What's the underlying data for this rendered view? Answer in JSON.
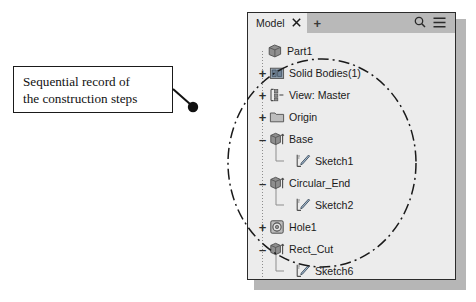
{
  "callout": {
    "line1": "Sequential record of",
    "line2": "the construction steps"
  },
  "panel": {
    "tab": {
      "label": "Model",
      "close_icon": "close-icon",
      "add_icon": "plus-icon"
    },
    "toolbar": {
      "search_icon": "search-icon",
      "menu_icon": "hamburger-menu-icon"
    },
    "tree": [
      {
        "label": "Part1",
        "expander": "",
        "indent": 6,
        "icon": "part-cube-icon",
        "depth": 0
      },
      {
        "label": "Solid Bodies(1)",
        "expander": "+",
        "indent": 8,
        "icon": "solid-bodies-icon",
        "depth": 1
      },
      {
        "label": "View: Master",
        "expander": "+",
        "indent": 8,
        "icon": "view-master-icon",
        "depth": 1
      },
      {
        "label": "Origin",
        "expander": "+",
        "indent": 8,
        "icon": "origin-folder-icon",
        "depth": 1
      },
      {
        "label": "Base",
        "expander": "–",
        "indent": 8,
        "icon": "extrude-icon",
        "depth": 1
      },
      {
        "label": "Sketch1",
        "expander": "",
        "indent": 34,
        "icon": "sketch-icon",
        "depth": 2
      },
      {
        "label": "Circular_End",
        "expander": "–",
        "indent": 8,
        "icon": "extrude-icon",
        "depth": 1
      },
      {
        "label": "Sketch2",
        "expander": "",
        "indent": 34,
        "icon": "sketch-icon",
        "depth": 2
      },
      {
        "label": "Hole1",
        "expander": "+",
        "indent": 8,
        "icon": "hole-icon",
        "depth": 1
      },
      {
        "label": "Rect_Cut",
        "expander": "–",
        "indent": 8,
        "icon": "extrude-icon",
        "depth": 1
      },
      {
        "label": "Sketch6",
        "expander": "",
        "indent": 34,
        "icon": "sketch-icon",
        "depth": 2
      },
      {
        "label": "End of Part",
        "expander": "",
        "indent": 8,
        "icon": "end-of-part-icon",
        "depth": 1
      }
    ]
  },
  "colors": {
    "panel_background": "#ececec",
    "tabstrip_background": "#b9b9b9",
    "panel_border": "#2b2b2b",
    "shadow": "#b6b6b6",
    "text": "#1a1a1a",
    "icon_fill": "#8a8a8a",
    "icon_stroke": "#4a4a4a",
    "annotation": "#1a1a1a"
  }
}
